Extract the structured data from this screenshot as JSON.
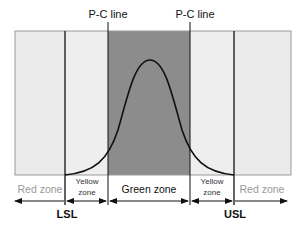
{
  "diagram": {
    "top_labels": {
      "pc_left": "P-C line",
      "pc_right": "P-C line"
    },
    "zones": [
      {
        "id": "red-left",
        "label": "Red zone",
        "label_lines": [
          "Red zone"
        ]
      },
      {
        "id": "yellow-left",
        "label": "Yellow zone",
        "label_lines": [
          "Yellow",
          "zone"
        ]
      },
      {
        "id": "green",
        "label": "Green zone",
        "label_lines": [
          "Green zone"
        ]
      },
      {
        "id": "yellow-right",
        "label": "Yellow zone",
        "label_lines": [
          "Yellow",
          "zone"
        ]
      },
      {
        "id": "red-right",
        "label": "Red zone",
        "label_lines": [
          "Red zone"
        ]
      }
    ],
    "limits": {
      "lsl": "LSL",
      "usl": "USL"
    },
    "colors": {
      "light_zone": "#ebebeb",
      "dark_zone": "#8c8c8c",
      "line": "#111111",
      "red_text": "#999999",
      "text": "#111111"
    }
  }
}
